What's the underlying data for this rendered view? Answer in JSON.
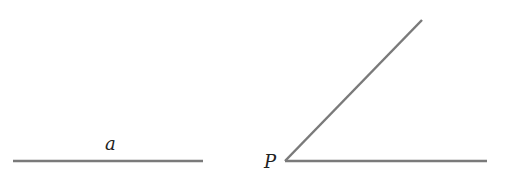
{
  "diagram": {
    "line_color": "#7a7a7a",
    "label_color": "#222222",
    "segment": {
      "label": "a",
      "x1": 13,
      "y1": 161,
      "x2": 203,
      "y2": 161
    },
    "angle": {
      "vertex_label": "P",
      "vertex": {
        "x": 285,
        "y": 161
      },
      "ray_horizontal_end": {
        "x": 487,
        "y": 161
      },
      "ray_upper_end": {
        "x": 422,
        "y": 20
      }
    }
  }
}
